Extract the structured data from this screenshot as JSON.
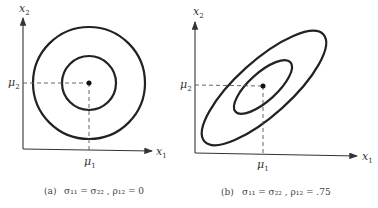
{
  "panels": [
    {
      "id": "a",
      "axis_x": "x",
      "axis_x_sub": "1",
      "axis_y": "x",
      "axis_y_sub": "2",
      "mu1": "μ",
      "mu1_sub": "1",
      "mu2": "μ",
      "mu2_sub": "2",
      "caption_tag": "(a)",
      "caption": "σ₁₁ = σ₂₂ , ρ₁₂ = 0"
    },
    {
      "id": "b",
      "axis_x": "x",
      "axis_x_sub": "1",
      "axis_y": "x",
      "axis_y_sub": "2",
      "mu1": "μ",
      "mu1_sub": "1",
      "mu2": "μ",
      "mu2_sub": "2",
      "caption_tag": "(b)",
      "caption": "σ₁₁ = σ₂₂ , ρ₁₂ = .75"
    }
  ],
  "colors": {
    "line": "#222222",
    "dash": "#555555"
  }
}
